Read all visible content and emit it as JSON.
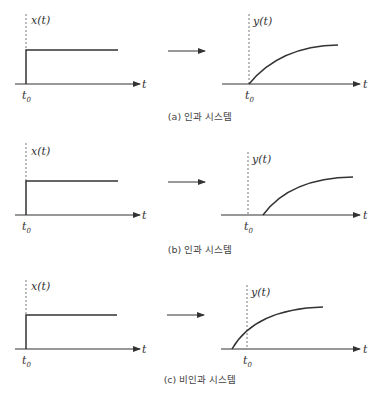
{
  "colors": {
    "line": "#333333",
    "dashed": "#555555",
    "text": "#333333"
  },
  "panels": [
    {
      "id": "a",
      "caption": "(a) 인과 시스템",
      "input": {
        "label": "x(t)",
        "axis_label": "t",
        "tick_label": "t",
        "tick_sub": "0"
      },
      "output": {
        "label": "y(t)",
        "axis_label": "t",
        "tick_label": "t",
        "tick_sub": "0",
        "response_start": "at t0"
      }
    },
    {
      "id": "b",
      "caption": "(b) 인과 시스템",
      "input": {
        "label": "x(t)",
        "axis_label": "t",
        "tick_label": "t",
        "tick_sub": "0"
      },
      "output": {
        "label": "y(t)",
        "axis_label": "t",
        "tick_label": "t",
        "tick_sub": "0",
        "response_start": "after t0"
      }
    },
    {
      "id": "c",
      "caption": "(c) 비인과 시스템",
      "input": {
        "label": "x(t)",
        "axis_label": "t",
        "tick_label": "t",
        "tick_sub": "0"
      },
      "output": {
        "label": "y(t)",
        "axis_label": "t",
        "tick_label": "t",
        "tick_sub": "0",
        "response_start": "before t0"
      }
    }
  ]
}
